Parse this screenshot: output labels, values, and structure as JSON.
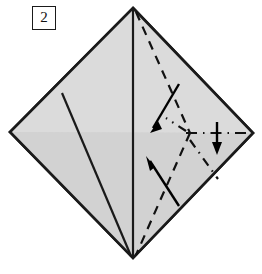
{
  "figure": {
    "step_label": "2",
    "canvas": {
      "width": 262,
      "height": 274
    },
    "colors": {
      "background": "#ffffff",
      "paper_fill": "#d4d4d4",
      "paper_fill_light": "#dcdcdc",
      "outline": "#1a1a1a",
      "crease": "#1a1a1a",
      "fold_line": "#111111",
      "arrow": "#000000",
      "badge_border": "#1a1a1a",
      "badge_text": "#111111"
    },
    "geometry": {
      "top_apex": {
        "x": 133,
        "y": 8
      },
      "bottom_apex": {
        "x": 133,
        "y": 258
      },
      "left_corner": {
        "x": 10,
        "y": 132
      },
      "right_corner": {
        "x": 253,
        "y": 133
      },
      "left_crease_top": {
        "x": 62,
        "y": 93
      },
      "center_node": {
        "x": 190,
        "y": 133
      }
    },
    "shapes": [
      {
        "name": "paper-diamond",
        "kind": "polygon",
        "label": "Square paper rotated 45 degrees, point up",
        "points": "133,8 253,133 133,258 10,132"
      }
    ],
    "creases": [
      {
        "name": "vertical-center-crease",
        "label": "Vertical centre crease from top apex to bottom apex",
        "x1": 133,
        "y1": 8,
        "x2": 133,
        "y2": 258
      },
      {
        "name": "left-diagonal-crease",
        "label": "Left diagonal crease from upper-left edge to bottom apex",
        "x1": 62,
        "y1": 93,
        "x2": 131,
        "y2": 256
      }
    ],
    "fold_lines": [
      {
        "name": "upper-right-valley-fold",
        "style": "dashed",
        "label": "Dashed valley fold from top apex to centre node",
        "points": "136,12 190,133"
      },
      {
        "name": "lower-right-valley-fold",
        "style": "dashed",
        "label": "Dashed valley fold from centre node to bottom apex",
        "points": "190,133 136,255"
      },
      {
        "name": "horizontal-dash-dot-fold",
        "style": "dash-dot",
        "label": "Horizontal dash-dot fold from centre node to right corner",
        "points": "186,133 250,133"
      },
      {
        "name": "upper-left-dash-dot-fold",
        "style": "dash-dot",
        "label": "Dash-dot fold rising left from centre node",
        "points": "186,131 168,120"
      },
      {
        "name": "lower-right-dash-dot-fold",
        "style": "dash-dot",
        "label": "Dash-dot fold descending right from centre node",
        "points": "190,140 217,177"
      }
    ],
    "arrows": [
      {
        "name": "upper-fold-arrow",
        "label": "Arrow showing upper flap folding down-left",
        "direction": "down-left",
        "from": {
          "x": 179,
          "y": 84
        },
        "to": {
          "x": 151,
          "y": 131
        }
      },
      {
        "name": "lower-fold-arrow",
        "label": "Arrow showing lower flap folding up-left",
        "direction": "up-left",
        "from": {
          "x": 179,
          "y": 206
        },
        "to": {
          "x": 147,
          "y": 157
        }
      },
      {
        "name": "right-fold-arrow",
        "label": "Short arrow pointing down across the horizontal fold",
        "direction": "down",
        "from": {
          "x": 217,
          "y": 122
        },
        "to": {
          "x": 217,
          "y": 153
        }
      }
    ]
  }
}
